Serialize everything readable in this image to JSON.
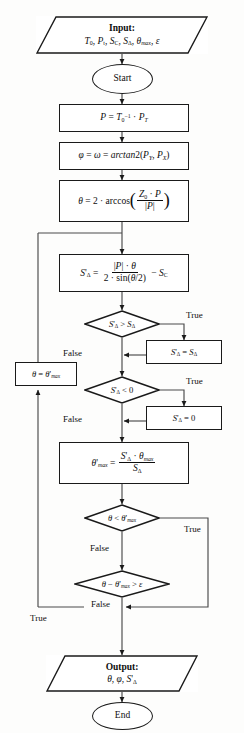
{
  "diagram": {
    "type": "flowchart",
    "orientation": "top-to-bottom",
    "line_color": "#1a1a1a",
    "background_color": "#fdfdfc"
  },
  "nodes": {
    "input": {
      "shape": "parallelogram",
      "label": "Input:",
      "parameters": "T0, Pt, SC, SDelta, thetamax, epsilon"
    },
    "start": {
      "shape": "ellipse",
      "label": "Start"
    },
    "calc_p": {
      "shape": "process",
      "formula": "P = T0^-1 . PT"
    },
    "calc_phi": {
      "shape": "process",
      "formula": "phi = omega = arctan2(PY, PX)"
    },
    "calc_theta": {
      "shape": "process",
      "formula": "theta = 2 . arccos( (Z0 . P) / |P| )"
    },
    "calc_sdelta": {
      "shape": "process",
      "formula": "S'Delta = (|P| . theta) / (2 . sin(theta/2)) - SC"
    },
    "dec_sdelta_gt": {
      "shape": "decision",
      "condition": "S'Delta > SDelta"
    },
    "assign_sdelta_max": {
      "shape": "process",
      "formula": "S'Delta = SDelta"
    },
    "dec_sdelta_lt0": {
      "shape": "decision",
      "condition": "S'Delta < 0"
    },
    "assign_sdelta_zero": {
      "shape": "process",
      "formula": "S'Delta = 0"
    },
    "calc_thetamax": {
      "shape": "process",
      "formula": "theta'max = (S'Delta . thetamax) / SDelta"
    },
    "dec_theta_lt": {
      "shape": "decision",
      "condition": "theta < theta'max"
    },
    "dec_theta_eps": {
      "shape": "decision",
      "condition": "theta - theta'max > epsilon"
    },
    "assign_theta": {
      "shape": "process",
      "formula": "theta = theta'max"
    },
    "output": {
      "shape": "parallelogram",
      "label": "Output:",
      "parameters": "theta, phi, S'Delta"
    },
    "end": {
      "shape": "ellipse",
      "label": "End"
    }
  },
  "edge_labels": {
    "true_1": "True",
    "false_1": "False",
    "true_2": "True",
    "false_2": "False",
    "true_3": "True",
    "false_3": "False",
    "true_4": "True",
    "false_4": "False"
  }
}
